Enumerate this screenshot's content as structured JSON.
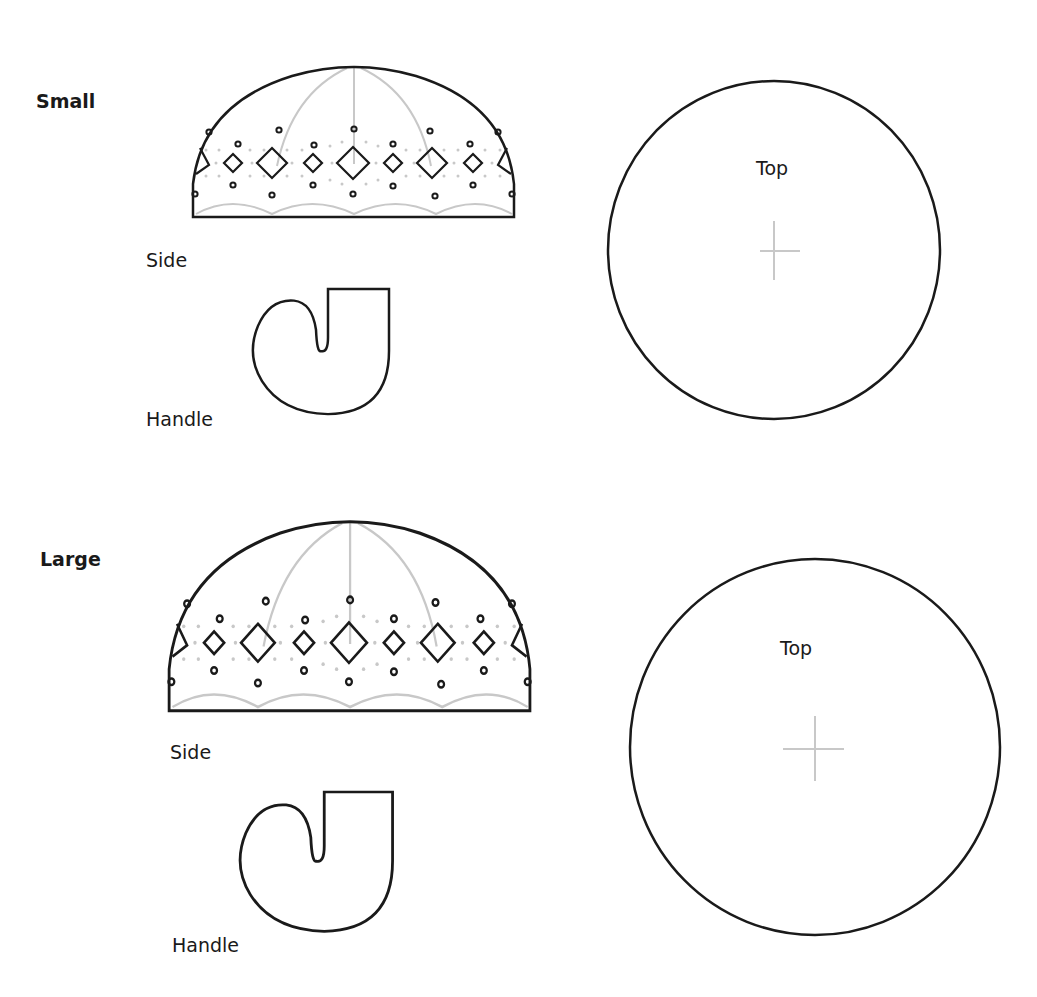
{
  "colors": {
    "outline": "#1a1a1a",
    "guide": "#c8c8c8",
    "background": "#ffffff"
  },
  "sections": [
    {
      "id": "small",
      "title": "Small",
      "side_label": "Side",
      "handle_label": "Handle",
      "top_label": "Top"
    },
    {
      "id": "large",
      "title": "Large",
      "side_label": "Side",
      "handle_label": "Handle",
      "top_label": "Top"
    }
  ]
}
